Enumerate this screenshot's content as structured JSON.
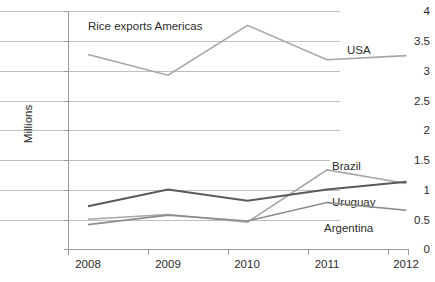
{
  "chart_data": {
    "type": "line",
    "title": "Rice exports Americas",
    "xlabel": "",
    "ylabel": "Millions",
    "categories": [
      "2008",
      "2009",
      "2010",
      "2011",
      "2012"
    ],
    "ylim": [
      0,
      4
    ],
    "yticks": [
      "0",
      "0.5",
      "1",
      "1.5",
      "2",
      "2.5",
      "3",
      "3.5",
      "4"
    ],
    "grid": true,
    "legend_position": "inline-labels",
    "series": [
      {
        "name": "USA",
        "color": "#a6a6a6",
        "values": [
          3.27,
          2.92,
          3.76,
          3.18,
          3.25
        ]
      },
      {
        "name": "Brazil",
        "color": "#a6a6a6",
        "values": [
          0.5,
          0.58,
          0.45,
          1.33,
          1.1
        ]
      },
      {
        "name": "Uruguay",
        "color": "#5a5a5a",
        "values": [
          0.72,
          1.0,
          0.81,
          1.0,
          1.13
        ]
      },
      {
        "name": "Argentina",
        "color": "#8c8c8c",
        "values": [
          0.41,
          0.57,
          0.47,
          0.78,
          0.65
        ]
      }
    ],
    "annotations": [
      {
        "text": "USA",
        "x": 345,
        "y": 50
      },
      {
        "text": "Brazil",
        "x": 330,
        "y": 166
      },
      {
        "text": "Uruguay",
        "x": 330,
        "y": 202
      },
      {
        "text": "Argentina",
        "x": 323,
        "y": 228
      }
    ]
  }
}
